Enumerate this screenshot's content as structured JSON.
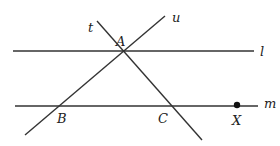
{
  "diagram": {
    "lines": [
      {
        "id": "l",
        "label": "l",
        "x1": 13,
        "y1": 51,
        "x2": 254,
        "y2": 51,
        "lx": 260,
        "ly": 56
      },
      {
        "id": "m",
        "label": "m",
        "x1": 15,
        "y1": 106,
        "x2": 258,
        "y2": 106,
        "lx": 264,
        "ly": 108
      },
      {
        "id": "t",
        "label": "t",
        "x1": 97,
        "y1": 21,
        "x2": 202,
        "y2": 140,
        "lx": 88,
        "ly": 32
      },
      {
        "id": "u",
        "label": "u",
        "x1": 165,
        "y1": 16,
        "x2": 25,
        "y2": 135,
        "lx": 172,
        "ly": 22
      }
    ],
    "points": [
      {
        "id": "A",
        "label": "A",
        "x": 123,
        "y": 51,
        "lx": 116,
        "ly": 46
      },
      {
        "id": "B",
        "label": "B",
        "x": 58,
        "y": 106,
        "lx": 57,
        "ly": 123
      },
      {
        "id": "C",
        "label": "C",
        "x": 172,
        "y": 106,
        "lx": 158,
        "ly": 123
      },
      {
        "id": "X",
        "label": "X",
        "x": 237,
        "y": 105,
        "lx": 232,
        "ly": 125,
        "marked": true
      }
    ],
    "stroke_color": "#333333",
    "dot_color": "#111111"
  }
}
